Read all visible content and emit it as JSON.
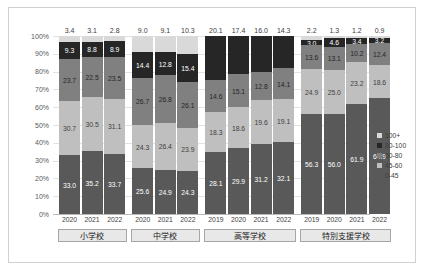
{
  "chart_data": {
    "type": "bar",
    "title": "",
    "xlabel": "",
    "ylabel": "",
    "stacked": true,
    "stack_mode": "percent",
    "ylim": [
      0,
      100
    ],
    "grid": true,
    "legend_position": "right",
    "ytick_labels": [
      "100%",
      "90%",
      "80%",
      "70%",
      "60%",
      "50%",
      "40%",
      "30%",
      "20%",
      "10%",
      "0%"
    ],
    "ytick_values": [
      100,
      90,
      80,
      70,
      60,
      50,
      40,
      30,
      20,
      10,
      0
    ],
    "legend": [
      "100+",
      "80-100",
      "60-80",
      "45-60",
      "0-45"
    ],
    "series": [
      {
        "name": "100+",
        "color": "#d9d9d9",
        "values": [
          3.4,
          3.1,
          2.8,
          9.0,
          9.1,
          10.3,
          null,
          null,
          null,
          null,
          2.2,
          1.3,
          1.2,
          0.9
        ]
      },
      {
        "name": "80-100",
        "color": "#262626",
        "values": [
          9.3,
          8.8,
          8.9,
          14.4,
          12.8,
          15.4,
          20.1,
          17.4,
          16.0,
          14.3,
          3.0,
          4.6,
          3.4,
          3.2
        ]
      },
      {
        "name": "60-80",
        "color": "#808080",
        "values": [
          23.7,
          22.5,
          23.5,
          26.7,
          26.8,
          26.1,
          14.6,
          15.1,
          12.8,
          14.1,
          13.6,
          13.1,
          10.2,
          12.4
        ]
      },
      {
        "name": "45-60",
        "color": "#bfbfbf",
        "values": [
          30.7,
          30.5,
          31.1,
          24.3,
          26.4,
          23.9,
          18.3,
          18.6,
          19.6,
          19.1,
          24.9,
          25.0,
          23.2,
          18.6
        ]
      },
      {
        "name": "0-45",
        "color": "#595959",
        "values": [
          33.0,
          35.2,
          33.7,
          25.6,
          24.9,
          24.3,
          28.1,
          29.9,
          31.2,
          32.1,
          56.3,
          56.0,
          61.9,
          64.9
        ]
      }
    ],
    "categories": [
      "2020",
      "2021",
      "2022",
      "2020",
      "2021",
      "2022",
      "2019",
      "2020",
      "2021",
      "2022",
      "2019",
      "2020",
      "2021",
      "2022"
    ],
    "groups": [
      {
        "label": "小学校",
        "count": 3
      },
      {
        "label": "中学校",
        "count": 3
      },
      {
        "label": "高等学校",
        "count": 4
      },
      {
        "label": "特別支援学校",
        "count": 4
      }
    ],
    "extra_series_labels": {
      "hs_80_100_above_bar": [
        20.1,
        17.4,
        16.0,
        14.3
      ]
    }
  }
}
